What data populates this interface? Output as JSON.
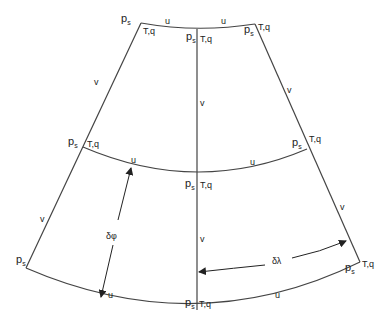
{
  "diagram": {
    "colors": {
      "line": "#444444",
      "text": "#222222",
      "background": "#ffffff"
    },
    "variables": {
      "ps": "p",
      "ps_sub": "s",
      "tq": "T,q",
      "u": "u",
      "v": "v",
      "dphi": "δφ",
      "dlambda": "δλ"
    },
    "nodes": [
      {
        "id": "top-left",
        "labels": [
          "ps",
          "T,q"
        ]
      },
      {
        "id": "top-center",
        "labels": [
          "ps",
          "T,q"
        ]
      },
      {
        "id": "top-right",
        "labels": [
          "ps",
          "T,q"
        ]
      },
      {
        "id": "mid-left",
        "labels": [
          "ps",
          "T,q"
        ]
      },
      {
        "id": "mid-center",
        "labels": [
          "ps",
          "T,q"
        ]
      },
      {
        "id": "mid-right",
        "labels": [
          "ps",
          "T,q"
        ]
      },
      {
        "id": "bot-left",
        "labels": [
          "ps"
        ]
      },
      {
        "id": "bot-center",
        "labels": [
          "ps",
          "T,q"
        ]
      },
      {
        "id": "bot-right",
        "labels": [
          "ps",
          "T,q"
        ]
      }
    ],
    "edges": {
      "horizontal_label": "u",
      "vertical_label": "v"
    },
    "arrows": [
      {
        "id": "delta-phi",
        "label": "δφ",
        "direction": "meridional"
      },
      {
        "id": "delta-lambda",
        "label": "δλ",
        "direction": "zonal"
      }
    ]
  }
}
